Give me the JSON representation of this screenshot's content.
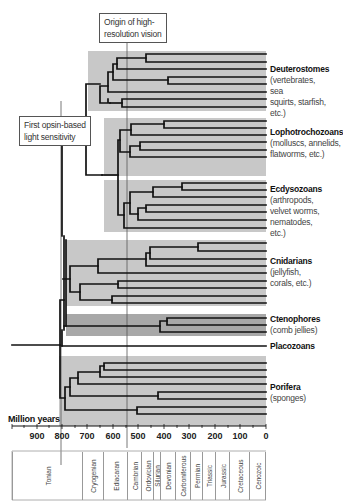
{
  "callouts": {
    "high_res_vision": {
      "line1": "Origin of high-",
      "line2": "resolution vision"
    },
    "opsin": {
      "line1": "First opsin-based",
      "line2": "light sensitivity"
    }
  },
  "clades": [
    {
      "name": "Deuterostomes",
      "desc": [
        "(vertebrates, sea",
        "squirts, starfish,",
        "etc.)"
      ]
    },
    {
      "name": "Lophotrochozoans",
      "desc": [
        "(molluscs, annelids,",
        "flatworms, etc.)"
      ]
    },
    {
      "name": "Ecdysozoans",
      "desc": [
        "(arthropods,",
        "velvet worms,",
        "nematodes, etc.)"
      ]
    },
    {
      "name": "Cnidarians",
      "desc": [
        "(jellyfish,",
        "corals, etc.)"
      ]
    },
    {
      "name": "Ctenophores",
      "desc": [
        "(comb jellies)"
      ]
    },
    {
      "name": "Placozoans",
      "desc": []
    },
    {
      "name": "Porifera",
      "desc": [
        "(sponges)"
      ]
    }
  ],
  "axis": {
    "title": "Million years",
    "ticks": [
      "900",
      "800",
      "700",
      "600",
      "500",
      "400",
      "300",
      "200",
      "100",
      "0"
    ]
  },
  "periods": [
    "Tonian",
    "Cryogenian",
    "Ediacaran",
    "Cambrian",
    "Ordovician",
    "Silurian",
    "Devonian",
    "Carboniferous",
    "Permian",
    "Triassic",
    "Jurassic",
    "Cretaceous",
    "Cenozoic"
  ],
  "colors": {
    "clade_box": "#c8c8c8",
    "ctenophore_box": "#a8a8a8",
    "branch": "#111111"
  }
}
